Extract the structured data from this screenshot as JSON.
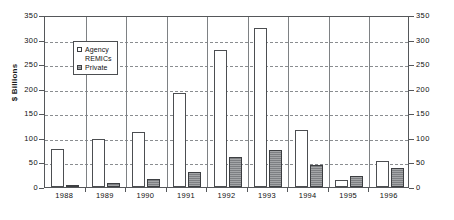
{
  "chart_data": {
    "type": "bar",
    "title": "",
    "subtitle": "",
    "xlabel": "",
    "ylabel": "$ Billions",
    "ylabel_right": "",
    "categories": [
      "1988",
      "1989",
      "1990",
      "1991",
      "1992",
      "1993",
      "1994",
      "1995",
      "1996"
    ],
    "series": [
      {
        "name": "Agency",
        "color": "#ffffff",
        "values": [
          78,
          98,
          112,
          192,
          278,
          323,
          117,
          14,
          52
        ]
      },
      {
        "name": "REMICs",
        "color": "#ffffff",
        "values": [
          0,
          0,
          0,
          0,
          0,
          0,
          0,
          0,
          0
        ]
      },
      {
        "name": "Private",
        "color": "#7d7f82",
        "values": [
          3,
          8,
          16,
          30,
          62,
          76,
          45,
          22,
          38
        ]
      }
    ],
    "ylim": [
      0,
      350
    ],
    "yticks": [
      0,
      50,
      100,
      150,
      200,
      250,
      300,
      350
    ],
    "ytick_labels": [
      "0",
      "50",
      "100",
      "150",
      "200",
      "250",
      "300",
      "350"
    ],
    "ytick_labels_right": [
      "0",
      "50",
      "100",
      "150",
      "200",
      "250",
      "300",
      "350"
    ],
    "grid": true,
    "grid_axis": "y",
    "legend_position": "upper-left-inside",
    "dual_axis": true
  },
  "legend": {
    "entries": [
      {
        "label": "Agency",
        "swatch": "agency-swatch"
      },
      {
        "label": "REMICs",
        "swatch": "remics-swatch"
      },
      {
        "label": "Private",
        "swatch": "private-swatch"
      }
    ]
  },
  "axes": {
    "y_title": "$ Billions"
  }
}
